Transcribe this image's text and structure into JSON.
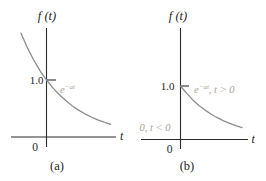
{
  "colors": {
    "background": "#ffffff",
    "axis": "#2a2a2a",
    "text": "#242424",
    "curve": "#8d8d8d",
    "muted_label": "#a9a39b"
  },
  "panels": {
    "a": {
      "caption": "(a)",
      "axis_label": "f (t)",
      "x_label": "t",
      "y_tick_label": "1.0",
      "origin_label": "0",
      "curve_label": {
        "base": "e",
        "sup": "−at",
        "rest": ""
      }
    },
    "b": {
      "caption": "(b)",
      "axis_label": "f (t)",
      "x_label": "t",
      "y_tick_label": "1.0",
      "origin_label": "0",
      "curve_label": {
        "base": "e",
        "sup": "−at",
        "rest": ", t > 0"
      },
      "zero_label": "0, t < 0"
    }
  },
  "chart_data": [
    {
      "panel": "a",
      "type": "line",
      "title": "(a)",
      "xlabel": "t",
      "ylabel": "f(t)",
      "yticks": [
        1.0
      ],
      "grid": false,
      "legend": "none",
      "function": "f(t) = e^{-at} for all t (shown with a = 1)",
      "annotations": [
        "e^{-at}"
      ],
      "series": [
        {
          "name": "e^{-at}",
          "t": [
            -0.6,
            -0.45,
            -0.3,
            -0.15,
            0,
            0.15,
            0.3,
            0.45,
            0.6,
            0.75,
            0.9,
            1.05,
            1.2,
            1.35,
            1.5
          ],
          "f": [
            1.822,
            1.568,
            1.35,
            1.162,
            1.0,
            0.861,
            0.741,
            0.638,
            0.549,
            0.472,
            0.407,
            0.35,
            0.301,
            0.259,
            0.223
          ]
        }
      ]
    },
    {
      "panel": "b",
      "type": "line",
      "title": "(b)",
      "xlabel": "t",
      "ylabel": "f(t)",
      "yticks": [
        1.0
      ],
      "grid": false,
      "legend": "none",
      "function": "f(t) = e^{-at} for t > 0, f(t) = 0 for t < 0 (shown with a = 1)",
      "annotations": [
        "e^{-at}, t > 0",
        "0, t < 0"
      ],
      "series": [
        {
          "name": "e^{-at}, t > 0; 0, t < 0",
          "t": [
            -0.6,
            -0.45,
            -0.3,
            -0.15,
            0,
            0.15,
            0.3,
            0.45,
            0.6,
            0.75,
            0.9,
            1.05,
            1.2,
            1.35,
            1.5
          ],
          "f": [
            0,
            0,
            0,
            0,
            1.0,
            0.861,
            0.741,
            0.638,
            0.549,
            0.472,
            0.407,
            0.35,
            0.301,
            0.259,
            0.223
          ]
        }
      ]
    }
  ]
}
